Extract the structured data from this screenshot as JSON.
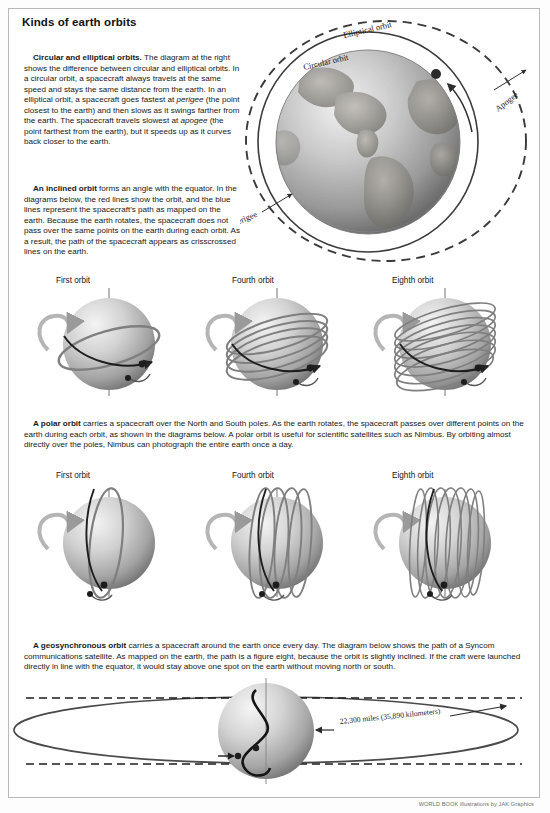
{
  "page": {
    "title": "Kinds of earth orbits",
    "credit": "WORLD BOOK illustrations by JAK Graphics",
    "background": "#ffffff",
    "border_color": "#b9b9b9"
  },
  "paragraphs": {
    "circular": {
      "lead": "Circular and elliptical orbits.",
      "text": " The diagram at the right shows the difference between circular and elliptical orbits. In a circular orbit, a spacecraft always travels at the same speed and stays the same distance from the earth. In an elliptical orbit, a spacecraft goes fastest at ",
      "em1": "perigee",
      "text2": " (the point closest to the earth) and then slows as it swings farther from the earth. The spacecraft travels slowest at ",
      "em2": "apogee",
      "text3": " (the point farthest from the earth), but it speeds up as it curves back closer to the earth."
    },
    "inclined": {
      "lead": "An inclined orbit",
      "text": " forms an angle with the equator. In the diagrams below, the red lines show the orbit, and the blue lines represent the spacecraft's path as mapped on the earth. Because the earth rotates, the spacecraft does not pass over the same points on the earth during each orbit. As a result, the path of the spacecraft appears as crisscrossed lines on the earth."
    },
    "polar": {
      "lead": "A polar orbit",
      "text": " carries a spacecraft over the North and South poles. As the earth rotates, the spacecraft passes over different points on the earth during each orbit, as shown in the diagrams below. A polar orbit is useful for scientific satellites such as Nimbus. By orbiting almost directly over the poles, Nimbus can photograph the entire earth once a day."
    },
    "geosynchronous": {
      "lead": "A geosynchronous orbit",
      "text": " carries a spacecraft around the earth once every day. The diagram below shows the path of a Syncom communications satellite. As mapped on the earth, the path is a figure eight, because the orbit is slightly inclined. If the craft were launched directly in line with the equator, it would stay above one spot on the earth without moving north or south."
    }
  },
  "earth_diagram": {
    "labels": {
      "elliptical_orbit": "Elliptical orbit",
      "circular_orbit": "Circular orbit",
      "apogee": "Apogee",
      "perigee": "Perigee"
    },
    "colors": {
      "orbit_line": "#3a3a3a",
      "satellite": "#2b2b2b",
      "globe_light": "#e8e8e8",
      "globe_dark": "#6e6e6e"
    }
  },
  "inclined_row": {
    "labels": [
      "First orbit",
      "Fourth orbit",
      "Eighth orbit"
    ],
    "orbit_counts": [
      1,
      4,
      8
    ]
  },
  "polar_row": {
    "labels": [
      "First orbit",
      "Fourth orbit",
      "Eighth orbit"
    ],
    "orbit_counts": [
      1,
      4,
      8
    ]
  },
  "geo_diagram": {
    "distance_label": "22,300 miles (35,890 kilometers)"
  }
}
